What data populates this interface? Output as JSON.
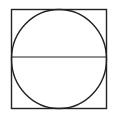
{
  "diagram": {
    "stroke_color": "#222222",
    "background": "#ffffff",
    "square": {
      "x": 11.5,
      "y": 9.5,
      "width": 95,
      "height": 99
    },
    "circle": {
      "cx": 59,
      "cy": 59,
      "rx": 47.5,
      "ry": 49.5
    },
    "diameter": {
      "x1": 11.5,
      "y1": 57,
      "x2": 106.5,
      "y2": 57
    }
  }
}
